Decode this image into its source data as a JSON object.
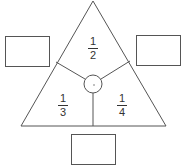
{
  "diagram": {
    "type": "fraction-triangle",
    "stroke_color": "#555555",
    "regions": [
      {
        "id": "top",
        "numerator": "1",
        "denominator": "2"
      },
      {
        "id": "bottom-left",
        "numerator": "1",
        "denominator": "3"
      },
      {
        "id": "bottom-right",
        "numerator": "1",
        "denominator": "4"
      }
    ],
    "center": {
      "symbol": "·"
    },
    "answer_boxes": [
      {
        "id": "left",
        "value": ""
      },
      {
        "id": "right",
        "value": ""
      },
      {
        "id": "bottom",
        "value": ""
      }
    ]
  }
}
